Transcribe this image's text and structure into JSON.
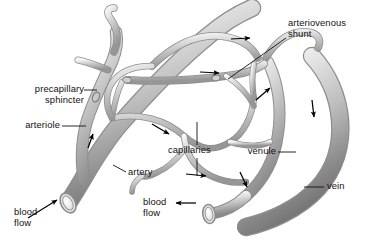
{
  "diagram": {
    "background_color": "#ffffff",
    "vessel_color_light": "#f2f2f2",
    "vessel_color_mid": "#b9b9b9",
    "vessel_color_dark": "#6e6e6e",
    "outline_color": "#8d8d8d",
    "label_color": "#111111",
    "arrow_color": "#000000"
  },
  "labels": {
    "precapillary_sphincter": "precapillary\nsphincter",
    "arteriole": "arteriole",
    "artery": "artery",
    "blood_flow_left": "blood\nflow",
    "blood_flow_bottom": "blood\nflow",
    "capillaries": "capillaries",
    "venule": "venule",
    "vein": "vein",
    "arteriovenous_shunt": "arteriovenous\nshunt"
  },
  "structures": [
    {
      "name": "artery",
      "type": "vessel",
      "caliber": "large",
      "flow": "inflow"
    },
    {
      "name": "arteriole",
      "type": "vessel",
      "caliber": "medium",
      "flow": "inflow"
    },
    {
      "name": "precapillary-sphincter",
      "type": "sphincter",
      "count": 3
    },
    {
      "name": "capillary-bed",
      "type": "network",
      "caliber": "small"
    },
    {
      "name": "arteriovenous-shunt",
      "type": "anastomosis"
    },
    {
      "name": "venule",
      "type": "vessel",
      "caliber": "medium",
      "flow": "outflow"
    },
    {
      "name": "vein",
      "type": "vessel",
      "caliber": "large",
      "flow": "outflow"
    }
  ],
  "flow_arrows": [
    {
      "id": "artery-inflow",
      "direction": "up-right"
    },
    {
      "id": "arteriole-up",
      "direction": "up-right"
    },
    {
      "id": "capillary-1",
      "direction": "right"
    },
    {
      "id": "capillary-2",
      "direction": "right"
    },
    {
      "id": "capillary-3",
      "direction": "down-right"
    },
    {
      "id": "capillary-4",
      "direction": "right"
    },
    {
      "id": "shunt-up",
      "direction": "up-right"
    },
    {
      "id": "venule-down",
      "direction": "down"
    },
    {
      "id": "vein-down",
      "direction": "down"
    },
    {
      "id": "vein-outflow",
      "direction": "left"
    }
  ]
}
